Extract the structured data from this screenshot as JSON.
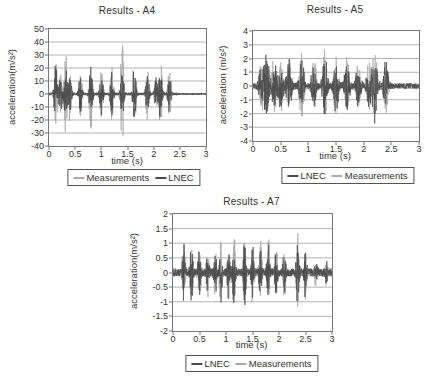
{
  "colors": {
    "measurements": "#a9a9a9",
    "lnec": "#4d4d4d",
    "grid": "#b3b3b3",
    "axis": "#777777",
    "text": "#333333"
  },
  "chart_data": [
    {
      "type": "line",
      "id": "a4",
      "title": "Results - A4",
      "xlabel": "time (s)",
      "ylabel": "acceleration(m/s²)",
      "xlim": [
        0,
        3
      ],
      "ylim": [
        -40,
        50
      ],
      "xticks": [
        "0",
        "0.5",
        "1",
        "1.5",
        "2",
        "2.5",
        "3"
      ],
      "yticks": [
        "50",
        "40",
        "30",
        "20",
        "10",
        "0",
        "-10",
        "-20",
        "-30",
        "-40"
      ],
      "grid": "horizontal",
      "legend_position": "bottom",
      "legend": [
        {
          "label": "Measurements",
          "color": "#a9a9a9"
        },
        {
          "label": "LNEC",
          "color": "#4d4d4d"
        }
      ],
      "series": [
        {
          "name": "Measurements",
          "color": "#a9a9a9",
          "seed": 11,
          "noise": 1.2,
          "burst_width": 0.035,
          "tail_end": 2.45,
          "tail_noise": 0.7,
          "bursts": [
            [
              0.13,
              25
            ],
            [
              0.22,
              18
            ],
            [
              0.32,
              33
            ],
            [
              0.4,
              22
            ],
            [
              0.6,
              20
            ],
            [
              0.8,
              30
            ],
            [
              1.0,
              22
            ],
            [
              1.2,
              24
            ],
            [
              1.4,
              45
            ],
            [
              1.63,
              34
            ],
            [
              1.88,
              22
            ],
            [
              2.05,
              18
            ],
            [
              2.13,
              30
            ],
            [
              2.3,
              24
            ]
          ]
        },
        {
          "name": "LNEC",
          "color": "#4d4d4d",
          "seed": 23,
          "noise": 1.0,
          "burst_width": 0.035,
          "tail_end": 2.45,
          "tail_noise": 0.6,
          "bursts": [
            [
              0.13,
              30
            ],
            [
              0.22,
              15
            ],
            [
              0.32,
              20
            ],
            [
              0.4,
              16
            ],
            [
              0.6,
              15
            ],
            [
              0.8,
              20
            ],
            [
              1.0,
              16
            ],
            [
              1.2,
              18
            ],
            [
              1.4,
              20
            ],
            [
              1.63,
              22
            ],
            [
              1.88,
              16
            ],
            [
              2.05,
              14
            ],
            [
              2.13,
              20
            ],
            [
              2.3,
              16
            ]
          ]
        }
      ]
    },
    {
      "type": "line",
      "id": "a5",
      "title": "Results - A5",
      "xlabel": "time (s)",
      "ylabel": "acceleration (m/s²)",
      "xlim": [
        0,
        3
      ],
      "ylim": [
        -4,
        4
      ],
      "xticks": [
        "0",
        "0.5",
        "1",
        "1.5",
        "2",
        "2.5",
        "3"
      ],
      "yticks": [
        "4",
        "3",
        "2",
        "1",
        "0",
        "-1",
        "-2",
        "-3",
        "-4"
      ],
      "grid": "horizontal",
      "legend_position": "bottom",
      "legend": [
        {
          "label": "LNEC",
          "color": "#4d4d4d"
        },
        {
          "label": "Measurements",
          "color": "#a9a9a9"
        }
      ],
      "series": [
        {
          "name": "Measurements",
          "color": "#a9a9a9",
          "seed": 37,
          "noise": 0.25,
          "burst_width": 0.05,
          "tail_end": 2.5,
          "tail_noise": 0.22,
          "bursts": [
            [
              0.15,
              1.8
            ],
            [
              0.25,
              2.2
            ],
            [
              0.38,
              2.0
            ],
            [
              0.5,
              1.8
            ],
            [
              0.65,
              2.1
            ],
            [
              0.88,
              2.4
            ],
            [
              1.1,
              2.0
            ],
            [
              1.3,
              2.6
            ],
            [
              1.5,
              2.2
            ],
            [
              1.7,
              2.1
            ],
            [
              1.9,
              1.9
            ],
            [
              2.1,
              1.8
            ],
            [
              2.2,
              2.6
            ],
            [
              2.4,
              2.0
            ]
          ]
        },
        {
          "name": "LNEC",
          "color": "#4d4d4d",
          "seed": 41,
          "noise": 0.22,
          "burst_width": 0.05,
          "tail_end": 2.5,
          "tail_noise": 0.2,
          "bursts": [
            [
              0.15,
              1.6
            ],
            [
              0.25,
              2.6
            ],
            [
              0.38,
              1.8
            ],
            [
              0.5,
              1.6
            ],
            [
              0.65,
              1.9
            ],
            [
              0.88,
              2.2
            ],
            [
              1.1,
              1.8
            ],
            [
              1.3,
              2.4
            ],
            [
              1.5,
              2.0
            ],
            [
              1.7,
              1.9
            ],
            [
              1.9,
              1.7
            ],
            [
              2.1,
              1.6
            ],
            [
              2.2,
              2.8
            ],
            [
              2.4,
              1.8
            ]
          ]
        }
      ]
    },
    {
      "type": "line",
      "id": "a7",
      "title": "Results - A7",
      "xlabel": "time (s)",
      "ylabel": "acceleration(m/s²)",
      "xlim": [
        0,
        3
      ],
      "ylim": [
        -2,
        2
      ],
      "xticks": [
        "0",
        "0.5",
        "1",
        "1.5",
        "2",
        "2.5",
        "3"
      ],
      "yticks": [
        "2",
        "1.5",
        "1",
        "0.5",
        "0",
        "-0.5",
        "-1",
        "-1.5",
        "-2"
      ],
      "grid": "horizontal",
      "legend_position": "bottom",
      "legend": [
        {
          "label": "LNEC",
          "color": "#4d4d4d"
        },
        {
          "label": "Measurements",
          "color": "#a9a9a9"
        }
      ],
      "series": [
        {
          "name": "Measurements",
          "color": "#a9a9a9",
          "seed": 53,
          "noise": 0.15,
          "burst_width": 0.03,
          "tail_end": 3.0,
          "tail_noise": 0.12,
          "bursts": [
            [
              0.2,
              1.3
            ],
            [
              0.35,
              1.3
            ],
            [
              0.5,
              0.9
            ],
            [
              0.65,
              1.0
            ],
            [
              0.8,
              0.9
            ],
            [
              0.9,
              1.1
            ],
            [
              1.05,
              1.0
            ],
            [
              1.15,
              1.4
            ],
            [
              1.35,
              1.5
            ],
            [
              1.5,
              1.2
            ],
            [
              1.65,
              1.1
            ],
            [
              1.8,
              1.2
            ],
            [
              1.95,
              1.0
            ],
            [
              2.1,
              0.9
            ],
            [
              2.35,
              1.6
            ],
            [
              2.5,
              1.0
            ],
            [
              2.7,
              0.5
            ],
            [
              2.9,
              0.4
            ]
          ]
        },
        {
          "name": "LNEC",
          "color": "#4d4d4d",
          "seed": 67,
          "noise": 0.13,
          "burst_width": 0.03,
          "tail_end": 3.0,
          "tail_noise": 0.1,
          "bursts": [
            [
              0.2,
              1.1
            ],
            [
              0.35,
              1.2
            ],
            [
              0.5,
              0.8
            ],
            [
              0.65,
              0.9
            ],
            [
              0.8,
              0.8
            ],
            [
              0.9,
              1.0
            ],
            [
              1.05,
              0.9
            ],
            [
              1.15,
              1.2
            ],
            [
              1.35,
              1.3
            ],
            [
              1.5,
              1.0
            ],
            [
              1.65,
              1.0
            ],
            [
              1.8,
              1.1
            ],
            [
              1.95,
              0.9
            ],
            [
              2.1,
              0.8
            ],
            [
              2.35,
              1.3
            ],
            [
              2.5,
              0.9
            ],
            [
              2.7,
              0.5
            ],
            [
              2.9,
              0.4
            ]
          ]
        }
      ]
    }
  ]
}
